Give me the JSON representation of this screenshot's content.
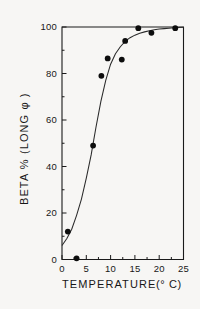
{
  "chart_data": {
    "type": "scatter",
    "title": "",
    "xlabel": "TEMPERATURE",
    "xlabel_units": "(° C)",
    "ylabel": "BETA %  (LONG φ )",
    "xlim": [
      0,
      25
    ],
    "ylim": [
      0,
      100
    ],
    "grid": false,
    "legend": "none",
    "x_ticks": [
      0,
      5,
      10,
      15,
      20,
      25
    ],
    "x_tick_labels": [
      "0",
      "5",
      "10",
      "15",
      "20",
      "25"
    ],
    "x_minor_ticks": [
      2.5,
      7.5,
      12.5,
      17.5,
      22.5
    ],
    "y_ticks": [
      0,
      20,
      40,
      60,
      80,
      100
    ],
    "y_tick_labels": [
      "0",
      "20",
      "40",
      "60",
      "80",
      "100"
    ],
    "y_minor_ticks": [
      10,
      30,
      50,
      70,
      90
    ],
    "series": [
      {
        "name": "Beta percent (long phi)",
        "marker": "filled-circle",
        "points": [
          {
            "x": 1.2,
            "y": 12.0
          },
          {
            "x": 3.0,
            "y": 0.5
          },
          {
            "x": 6.4,
            "y": 49.0
          },
          {
            "x": 8.1,
            "y": 79.0
          },
          {
            "x": 9.4,
            "y": 86.5
          },
          {
            "x": 12.3,
            "y": 86.0
          },
          {
            "x": 13.0,
            "y": 94.0
          },
          {
            "x": 15.7,
            "y": 99.5
          },
          {
            "x": 18.4,
            "y": 97.5
          },
          {
            "x": 23.3,
            "y": 99.5
          }
        ]
      }
    ],
    "fit_curve": {
      "name": "sigmoid fit",
      "points": [
        {
          "x": 0.0,
          "y": 6.0
        },
        {
          "x": 1.0,
          "y": 9.0
        },
        {
          "x": 2.0,
          "y": 13.0
        },
        {
          "x": 3.0,
          "y": 19.0
        },
        {
          "x": 4.0,
          "y": 26.0
        },
        {
          "x": 5.0,
          "y": 35.0
        },
        {
          "x": 6.0,
          "y": 45.0
        },
        {
          "x": 6.5,
          "y": 51.0
        },
        {
          "x": 7.0,
          "y": 57.0
        },
        {
          "x": 8.0,
          "y": 68.0
        },
        {
          "x": 9.0,
          "y": 77.0
        },
        {
          "x": 10.0,
          "y": 84.0
        },
        {
          "x": 11.0,
          "y": 88.5
        },
        {
          "x": 12.0,
          "y": 91.5
        },
        {
          "x": 13.0,
          "y": 93.8
        },
        {
          "x": 14.0,
          "y": 95.4
        },
        {
          "x": 15.0,
          "y": 96.5
        },
        {
          "x": 16.0,
          "y": 97.3
        },
        {
          "x": 17.0,
          "y": 97.9
        },
        {
          "x": 18.0,
          "y": 98.4
        },
        {
          "x": 19.0,
          "y": 98.8
        },
        {
          "x": 20.0,
          "y": 99.1
        },
        {
          "x": 21.0,
          "y": 99.3
        },
        {
          "x": 22.0,
          "y": 99.5
        },
        {
          "x": 23.0,
          "y": 99.7
        },
        {
          "x": 24.0,
          "y": 99.8
        },
        {
          "x": 25.0,
          "y": 99.9
        }
      ]
    },
    "colors": {
      "marker": "#0d0d0d",
      "curve": "#2a2a2a",
      "axis": "#1a1a1a",
      "background": "#f7f6f4"
    }
  }
}
